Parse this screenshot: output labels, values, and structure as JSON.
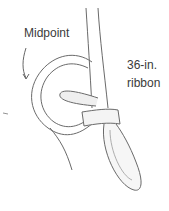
{
  "labels": {
    "midpoint": "Midpoint",
    "ribbon_line1": "36-in.",
    "ribbon_line2": "ribbon"
  },
  "colors": {
    "stroke": "#6a6a6a",
    "shade": "#d8d8d8",
    "text": "#3a3a3a"
  }
}
